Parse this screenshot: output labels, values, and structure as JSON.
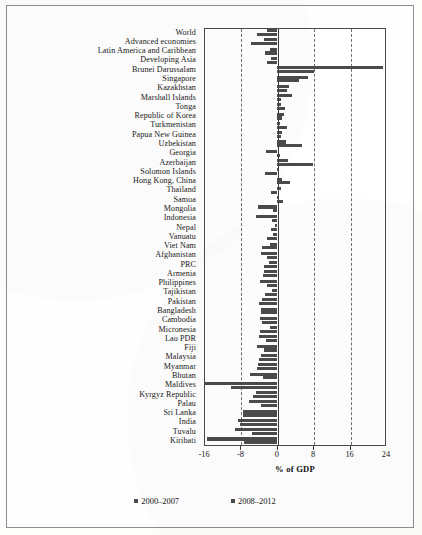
{
  "chart_data": {
    "type": "bar",
    "orientation": "horizontal",
    "title": "",
    "xlabel": "% of GDP",
    "ylabel": "",
    "xlim": [
      -16,
      24
    ],
    "xticks": [
      -16,
      -8,
      0,
      8,
      16,
      24
    ],
    "xtick_labels": [
      "-16",
      "-8",
      "0",
      "8",
      "16",
      "24"
    ],
    "grid": true,
    "grid_style": "dashed-vertical",
    "legend_position": "bottom-center",
    "legend": [
      "2000–2007",
      "2008–2012"
    ],
    "categories": [
      "World",
      "Advanced economies",
      "Latin America and Caribbean",
      "Developing Asia",
      "Brunei Darussalam",
      "Singapore",
      "Kazakhstan",
      "Marshall Islands",
      "Tonga",
      "Republic of Korea",
      "Turkmenistan",
      "Papua New Guinea",
      "Uzbekistan",
      "Georgia",
      "Azerbaijan",
      "Solomon Islands",
      "Hong Kong, China",
      "Thailand",
      "Samoa",
      "Mongolia",
      "Indonesia",
      "Nepal",
      "Vanuatu",
      "Viet Nam",
      "Afghanistan",
      "PRC",
      "Armenia",
      "Philippines",
      "Tajikistan",
      "Pakistan",
      "Bangladesh",
      "Cambodia",
      "Micronesia",
      "Lao PDR",
      "Fiji",
      "Malaysia",
      "Myanmar",
      "Bhutan",
      "Maldives",
      "Kyrgyz Republic",
      "Palau",
      "Sri Lanka",
      "India",
      "Tuvalu",
      "Kiribati"
    ],
    "series": [
      {
        "name": "2000–2007",
        "values": [
          -2.1,
          -2.8,
          -1.5,
          -1.2,
          23.4,
          6.8,
          2.6,
          3.4,
          0.9,
          1.6,
          0.8,
          1.2,
          2.1,
          -2.3,
          2.5,
          0.4,
          1.1,
          1.0,
          0.4,
          -4.1,
          -4.5,
          -0.5,
          -0.9,
          -1.4,
          -3.5,
          -1.8,
          -2.9,
          -3.6,
          -1.0,
          -3.3,
          -3.4,
          -3.8,
          -1.6,
          -3.9,
          -4.3,
          -3.4,
          -4.2,
          -5.9,
          -16.0,
          -4.6,
          -6.2,
          -7.5,
          -8.5,
          -9.2,
          -15.4
        ]
      },
      {
        "name": "2008–2012",
        "values": [
          -4.3,
          -5.6,
          -2.6,
          -2.1,
          8.1,
          4.8,
          2.2,
          1.0,
          1.9,
          1.1,
          2.3,
          1.0,
          5.6,
          0.6,
          7.9,
          -2.5,
          2.8,
          -1.2,
          1.3,
          -0.9,
          -1.0,
          -1.3,
          -2.1,
          -3.2,
          -2.2,
          -2.9,
          -3.0,
          -2.2,
          -2.6,
          -4.0,
          -3.5,
          -3.2,
          -3.7,
          -2.4,
          -2.8,
          -4.0,
          -4.4,
          -3.0,
          -10.0,
          -5.2,
          -3.5,
          -7.4,
          -8.0,
          -5.4,
          -7.3
        ]
      }
    ]
  },
  "axis": {
    "x_title": "% of GDP"
  }
}
